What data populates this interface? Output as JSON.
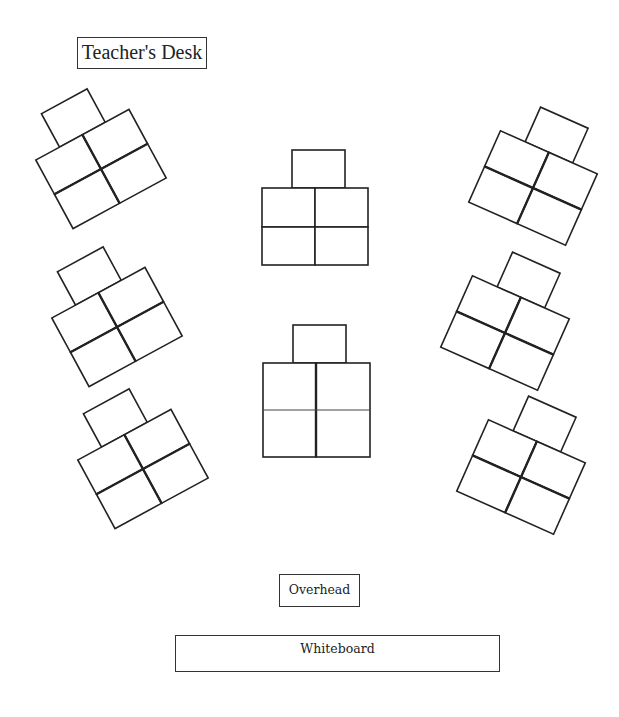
{
  "labels": {
    "teacher_desk": "Teacher's Desk",
    "overhead": "Overhead",
    "whiteboard": "Whiteboard"
  },
  "colors": {
    "outline": "#222222",
    "background": "#ffffff"
  },
  "desk_groups": [
    {
      "id": "left-top",
      "center": [
        101,
        169
      ],
      "rotation": -28.5,
      "desks": 5
    },
    {
      "id": "left-middle",
      "center": [
        117,
        327
      ],
      "rotation": -28.5,
      "desks": 5
    },
    {
      "id": "left-bottom",
      "center": [
        143,
        469
      ],
      "rotation": -28.5,
      "desks": 5
    },
    {
      "id": "center-top",
      "center": [
        315,
        226
      ],
      "rotation": 0,
      "desks": 5
    },
    {
      "id": "center-bottom",
      "center": [
        316,
        410
      ],
      "rotation": 0,
      "desks": 5
    },
    {
      "id": "right-top",
      "center": [
        533,
        188
      ],
      "rotation": 24,
      "desks": 5
    },
    {
      "id": "right-middle",
      "center": [
        505,
        333
      ],
      "rotation": 24,
      "desks": 5
    },
    {
      "id": "right-bottom",
      "center": [
        521,
        477
      ],
      "rotation": 24,
      "desks": 5
    }
  ]
}
